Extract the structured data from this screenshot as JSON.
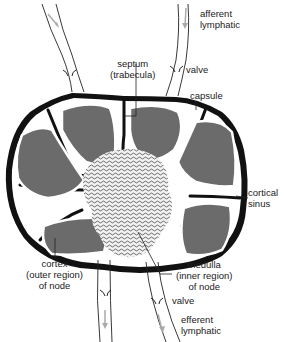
{
  "diagram": {
    "title_partial": "",
    "colors": {
      "cortex_fill": "#6b6b6b",
      "capsule": "#111111",
      "medulla_fill": "#e8e8e8",
      "arrow": "#a9a9a9",
      "background": "#ffffff"
    },
    "labels": {
      "afferent": [
        "afferent",
        "lymphatic"
      ],
      "valve_top": "valve",
      "septum": [
        "septum",
        "(trabecula)"
      ],
      "capsule": "capsule",
      "cortical_sinus": [
        "cortical",
        "sinus"
      ],
      "cortex": [
        "cortex",
        "(outer region)",
        "of node"
      ],
      "medulla": [
        "medulla",
        "(inner region)",
        "of node"
      ],
      "valve_bottom": "valve",
      "efferent": [
        "efferent",
        "lymphatic"
      ]
    }
  }
}
